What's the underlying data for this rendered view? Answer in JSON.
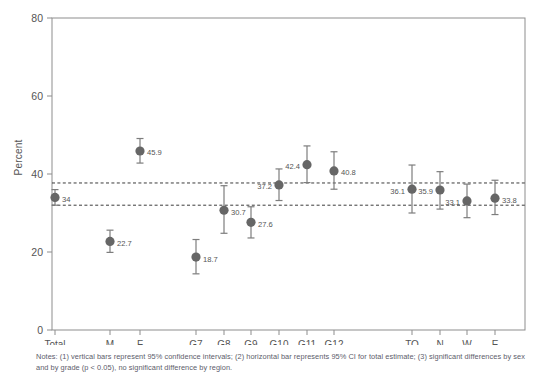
{
  "figure": {
    "ylabel": "Percent",
    "notes": "Notes: (1) vertical bars represent 95% confidence intervals; (2) horizontal bar represents 95% CI for total estimate; (3) significant differences by sex and by grade (p < 0.05), no significant difference by region."
  },
  "chart_data": {
    "type": "scatter",
    "title": "",
    "xlabel": "",
    "ylabel": "Percent",
    "ylim": [
      0,
      80
    ],
    "yticks": [
      0,
      20,
      40,
      60,
      80
    ],
    "grid": false,
    "legend": "none",
    "categories": [
      "Total",
      "M",
      "F",
      "G7",
      "G8",
      "G9",
      "G10",
      "G11",
      "G12",
      "TO",
      "N",
      "W",
      "E"
    ],
    "values": [
      34,
      22.7,
      45.9,
      18.7,
      30.7,
      27.6,
      37.2,
      42.4,
      40.8,
      36.1,
      35.9,
      33.1,
      33.8
    ],
    "point_labels": [
      "34",
      "22.7",
      "45.9",
      "18.7",
      "30.7",
      "27.6",
      "37.2",
      "42.4",
      "40.8",
      "36.1",
      "35.9",
      "33.1",
      "33.8"
    ],
    "label_side": [
      "right",
      "right",
      "right",
      "right",
      "right",
      "right",
      "left",
      "left",
      "right",
      "left",
      "left",
      "left",
      "right"
    ],
    "ci_low": [
      32.0,
      19.9,
      42.8,
      14.4,
      24.8,
      23.6,
      33.2,
      37.8,
      36.1,
      30.0,
      31.0,
      28.8,
      29.6
    ],
    "ci_high": [
      36.0,
      25.6,
      49.1,
      23.2,
      37.0,
      31.6,
      41.3,
      47.2,
      45.7,
      42.3,
      40.6,
      37.4,
      38.4
    ],
    "x_positions": [
      55,
      110,
      140,
      196,
      224,
      251,
      279,
      307,
      334,
      412,
      440,
      467,
      495
    ],
    "total_ci_band": {
      "label": "95% CI for total estimate",
      "low": 32.0,
      "high": 37.7
    },
    "marker_color": "#666666",
    "errorbar_color": "#7d7d7d",
    "ci_line_color": "#3b3b3b"
  }
}
